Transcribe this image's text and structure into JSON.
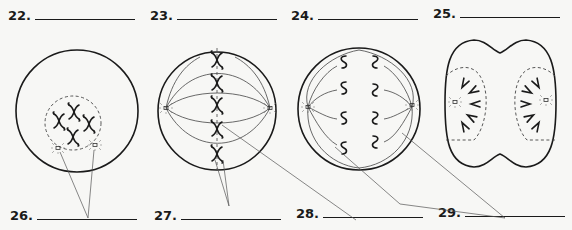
{
  "worksheet": {
    "top_labels": [
      {
        "number": "22.",
        "answer": ""
      },
      {
        "number": "23.",
        "answer": ""
      },
      {
        "number": "24.",
        "answer": ""
      },
      {
        "number": "25.",
        "answer": ""
      }
    ],
    "bottom_labels": [
      {
        "number": "26.",
        "answer": ""
      },
      {
        "number": "27.",
        "answer": ""
      },
      {
        "number": "28.",
        "answer": ""
      },
      {
        "number": "29.",
        "answer": ""
      }
    ],
    "figures": [
      {
        "id": "cell-22",
        "description": "cell with nucleus, condensed chromosomes and centrioles"
      },
      {
        "id": "cell-23",
        "description": "cell with chromosomes aligned at equator and spindle fibers"
      },
      {
        "id": "cell-24",
        "description": "cell with chromatids separating toward poles"
      },
      {
        "id": "cell-25",
        "description": "dividing cell with two forming nuclei"
      }
    ]
  }
}
